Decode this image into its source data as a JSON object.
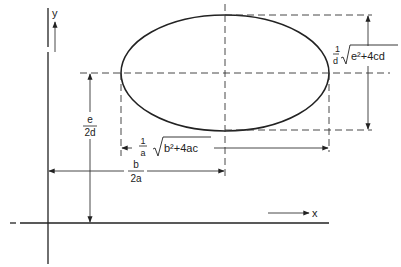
{
  "diagram": {
    "type": "ellipse-geometry",
    "axes": {
      "x_label": "x",
      "y_label": "y"
    },
    "labels": {
      "vertical_offset": {
        "numerator": "e",
        "denominator": "2d"
      },
      "horizontal_offset": {
        "numerator": "b",
        "denominator": "2a"
      },
      "horizontal_width": {
        "coef_numerator": "1",
        "coef_denominator": "a",
        "radicand": "b²+4ac"
      },
      "vertical_height": {
        "coef_numerator": "1",
        "coef_denominator": "d",
        "radicand": "e²+4cd"
      }
    },
    "colors": {
      "ink": "#222222",
      "background": "#ffffff"
    }
  }
}
